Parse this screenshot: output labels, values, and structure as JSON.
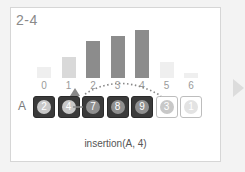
{
  "title": "2-4",
  "row_label": "A",
  "caption": "insertion(A, 4)",
  "array": {
    "indices": [
      "0",
      "1",
      "2",
      "3",
      "4",
      "5",
      "6"
    ],
    "values": [
      2,
      4,
      7,
      8,
      9,
      3,
      1
    ],
    "sorted_count": 5,
    "key_index": 1
  },
  "colors": {
    "bar_dark": "#8c8c8c",
    "bar_light": "#d9d9d9",
    "bar_faint": "#efefef",
    "disc_dark": "#8f8f8f",
    "disc_light": "#c8c8c8",
    "disc_faint": "#e3e3e3"
  },
  "icons": {
    "next": "next-arrow-icon",
    "shift_arrow": "curved-dotted-arrow-icon"
  }
}
